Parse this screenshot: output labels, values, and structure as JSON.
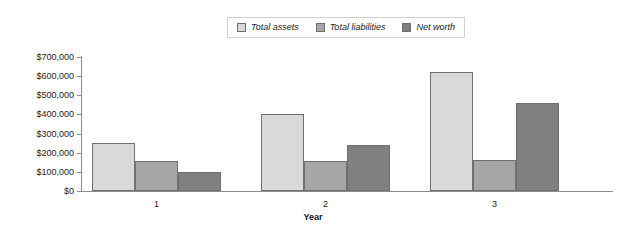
{
  "chart_data": {
    "type": "bar",
    "title": "",
    "subtitle": "",
    "xlabel": "Year",
    "ylabel": "",
    "categories": [
      "1",
      "2",
      "3"
    ],
    "series": [
      {
        "name": "Total assets",
        "color": "#d9d9d9",
        "values": [
          250000,
          400000,
          620000
        ]
      },
      {
        "name": "Total liabilities",
        "color": "#a6a6a6",
        "values": [
          155000,
          155000,
          160000
        ]
      },
      {
        "name": "Net worth",
        "color": "#808080",
        "values": [
          100000,
          240000,
          460000
        ]
      }
    ],
    "ylim": [
      0,
      700000
    ],
    "ytick_labels": [
      "$0",
      "$100,000",
      "$200,000",
      "$300,000",
      "$400,000",
      "$500,000",
      "$600,000",
      "$700,000"
    ],
    "ytick_values": [
      0,
      100000,
      200000,
      300000,
      400000,
      500000,
      600000,
      700000
    ],
    "grid": false,
    "legend_position": "top-center",
    "legend_entries": [
      "Total assets",
      "Total liabilities",
      "Net worth"
    ],
    "annotations": []
  },
  "legend": {
    "item0_label": "Total assets",
    "item1_label": "Total liabilities",
    "item2_label": "Net worth"
  },
  "axis": {
    "x_title": "Year",
    "x_label_0": "1",
    "x_label_1": "2",
    "x_label_2": "3",
    "y_label_0": "$0",
    "y_label_1": "$100,000",
    "y_label_2": "$200,000",
    "y_label_3": "$300,000",
    "y_label_4": "$400,000",
    "y_label_5": "$500,000",
    "y_label_6": "$600,000",
    "y_label_7": "$700,000"
  },
  "colors": {
    "total_assets": "#d9d9d9",
    "total_liabilities": "#a6a6a6",
    "net_worth": "#808080",
    "axis": "#8c8c8c",
    "bar_outline": "#707070",
    "background": "#ffffff"
  }
}
